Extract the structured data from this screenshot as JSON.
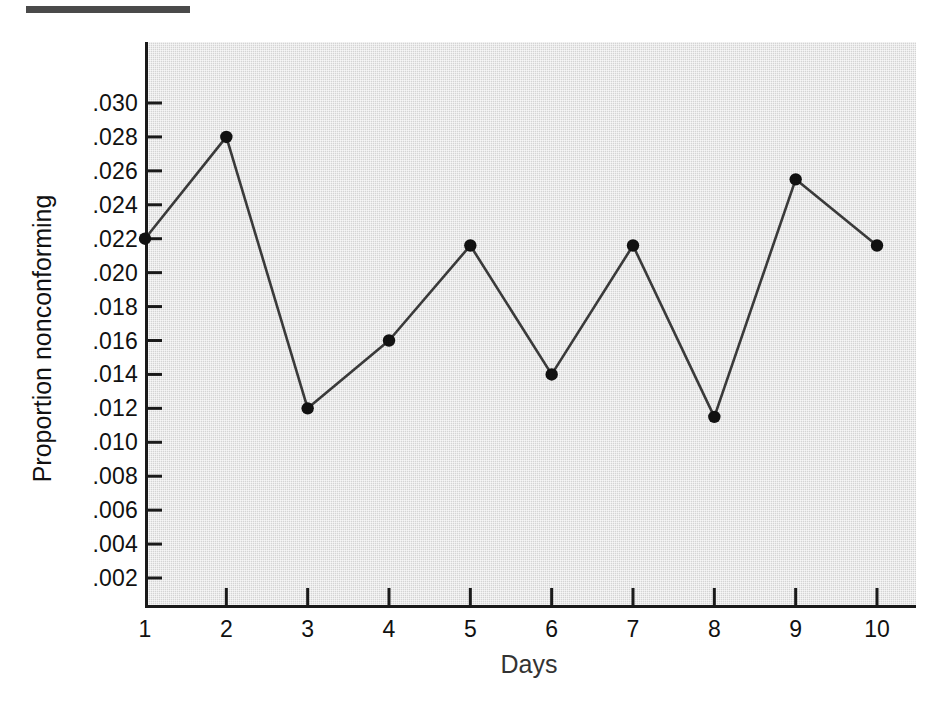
{
  "figure": {
    "top_rule_present": true
  },
  "chart_data": {
    "type": "line",
    "title": "",
    "xlabel": "Days",
    "ylabel": "Proportion nonconforming",
    "x": [
      1,
      2,
      3,
      4,
      5,
      6,
      7,
      8,
      9,
      10
    ],
    "categories": [
      "1",
      "2",
      "3",
      "4",
      "5",
      "6",
      "7",
      "8",
      "9",
      "10"
    ],
    "values": [
      0.022,
      0.028,
      0.012,
      0.016,
      0.0216,
      0.014,
      0.0216,
      0.0115,
      0.0255,
      0.0216
    ],
    "series": [
      {
        "name": "Proportion nonconforming",
        "values": [
          0.022,
          0.028,
          0.012,
          0.016,
          0.0216,
          0.014,
          0.0216,
          0.0115,
          0.0255,
          0.0216
        ]
      }
    ],
    "xlim": [
      1,
      10
    ],
    "ylim": [
      0.0,
      0.0315
    ],
    "ytick_values": [
      0.03,
      0.028,
      0.026,
      0.024,
      0.022,
      0.02,
      0.018,
      0.016,
      0.014,
      0.012,
      0.01,
      0.008,
      0.006,
      0.004,
      0.002
    ],
    "ytick_labels": [
      ".030",
      ".028",
      ".026",
      ".024",
      ".022",
      ".020",
      ".018",
      ".016",
      ".014",
      ".012",
      ".010",
      ".008",
      ".006",
      ".004",
      ".002"
    ],
    "xtick_labels": [
      "1",
      "2",
      "3",
      "4",
      "5",
      "6",
      "7",
      "8",
      "9",
      "10"
    ],
    "grid": false,
    "legend": null,
    "marker": "filled-circle",
    "colors": {
      "plot_background": "#d4d4d4",
      "axis": "#1a1a1a",
      "line": "#3a3a3a",
      "marker": "#111111",
      "text": "#111111",
      "page_background": "#ffffff",
      "top_rule": "#4a4a4a"
    }
  }
}
